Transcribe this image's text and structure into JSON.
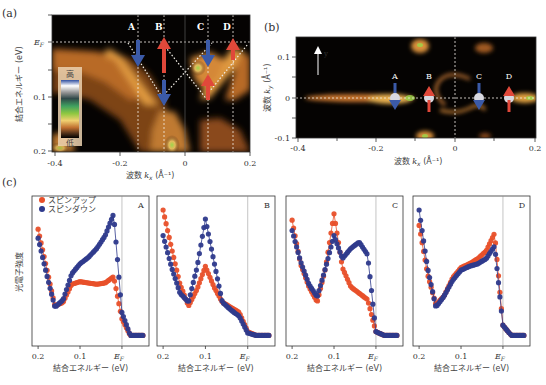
{
  "figure": {
    "panel_labels": [
      "(a)",
      "(b)",
      "(c)"
    ]
  },
  "panel_a": {
    "ylabel": "結合エネルギー (eV)",
    "xlabel": "波数 kx (Å⁻¹)",
    "xlabel_main": "波数 ",
    "xlabel_var": "k",
    "xlabel_sub": "x",
    "xlabel_unit": " (Å⁻¹)",
    "yticks": [
      "EF",
      "0.1",
      "0.2"
    ],
    "ytick_ef_main": "E",
    "ytick_ef_sub": "F",
    "xticks": [
      "-0.4",
      "-0.2",
      "0",
      "0.2"
    ],
    "cut_labels": [
      "A",
      "B",
      "C",
      "D"
    ],
    "colorbar": {
      "high": "高",
      "low": "低"
    }
  },
  "panel_b": {
    "ylabel": "波数 ky (Å⁻¹)",
    "ylabel_main": "波数 ",
    "ylabel_var": "k",
    "ylabel_sub": "y",
    "ylabel_unit": " (Å⁻¹)",
    "xlabel_main": "波数 ",
    "xlabel_var": "k",
    "xlabel_sub": "x",
    "xlabel_unit": " (Å⁻¹)",
    "yticks": [
      "0.1",
      "0",
      "-0.1"
    ],
    "xticks": [
      "-0.4",
      "-0.2",
      "0",
      "0.2"
    ],
    "axis_arrow_label": "y",
    "cut_labels": [
      "A",
      "B",
      "C",
      "D"
    ]
  },
  "panel_c": {
    "ylabel": "光電子強度",
    "xlabel": "結合エネルギー (eV)",
    "xticks": [
      "0.2",
      "0.1",
      "EF"
    ],
    "xtick_ef_main": "E",
    "xtick_ef_sub": "F",
    "legend": [
      "スピンアップ",
      "スピンダウン"
    ],
    "subpanels": [
      "A",
      "B",
      "C",
      "D"
    ]
  },
  "colors": {
    "spin_up": "#e8502a",
    "spin_down": "#2e3a8c",
    "arpes_bg": "#050302",
    "arpes_band": "#d98a3a"
  },
  "chart_data": [
    {
      "type": "heatmap",
      "title": "(a) ARPES band dispersion",
      "xlabel": "波数 kx (Å⁻¹)",
      "ylabel": "結合エネルギー (eV)",
      "xlim": [
        -0.4,
        0.2
      ],
      "ylim": [
        0.2,
        0.0
      ],
      "x_ticks": [
        -0.4,
        -0.2,
        0,
        0.2
      ],
      "y_ticks": [
        "EF",
        0.1,
        0.2
      ],
      "colorbar": [
        "高",
        "低"
      ],
      "cuts": [
        {
          "label": "A",
          "kx": -0.15,
          "spin": "down",
          "energy_of_arrow": 0.03
        },
        {
          "label": "B",
          "kx": -0.065,
          "spin": "up",
          "energy_of_arrow": 0.02
        },
        {
          "label": "B",
          "kx": -0.065,
          "spin": "down",
          "energy_of_arrow": 0.11
        },
        {
          "label": "C",
          "kx": 0.07,
          "spin": "down",
          "energy_of_arrow": 0.03
        },
        {
          "label": "C",
          "kx": 0.07,
          "spin": "up",
          "energy_of_arrow": 0.09
        },
        {
          "label": "D",
          "kx": 0.15,
          "spin": "up",
          "energy_of_arrow": 0.02
        }
      ]
    },
    {
      "type": "heatmap",
      "title": "(b) Fermi surface map",
      "xlabel": "波数 kx (Å⁻¹)",
      "ylabel": "波数 ky (Å⁻¹)",
      "xlim": [
        -0.4,
        0.2
      ],
      "ylim": [
        -0.1,
        0.15
      ],
      "x_ticks": [
        -0.4,
        -0.2,
        0,
        0.2
      ],
      "y_ticks": [
        0.1,
        0,
        -0.1
      ],
      "points": [
        {
          "label": "A",
          "kx": -0.15,
          "ky": 0,
          "spin": "down"
        },
        {
          "label": "B",
          "kx": -0.065,
          "spin": "up",
          "ky": 0
        },
        {
          "label": "C",
          "kx": 0.065,
          "ky": 0,
          "spin": "down"
        },
        {
          "label": "D",
          "kx": 0.14,
          "ky": 0,
          "spin": "up"
        }
      ]
    },
    {
      "type": "scatter",
      "title": "(c) Spin-resolved EDCs",
      "xlabel": "結合エネルギー (eV)",
      "ylabel": "光電子強度",
      "x_ticks": [
        0.2,
        0.1,
        "EF"
      ],
      "xlim": [
        0.21,
        -0.06
      ],
      "legend": [
        "スピンアップ",
        "スピンダウン"
      ],
      "x": [
        0.2,
        0.18,
        0.16,
        0.14,
        0.12,
        0.1,
        0.08,
        0.06,
        0.04,
        0.02,
        0.0,
        -0.02,
        -0.05
      ],
      "subpanels": [
        {
          "label": "A",
          "series": [
            {
              "name": "スピンアップ",
              "values": [
                0.85,
                0.55,
                0.25,
                0.28,
                0.42,
                0.44,
                0.43,
                0.42,
                0.43,
                0.48,
                0.15,
                0.02,
                0.02
              ]
            },
            {
              "name": "スピンダウン",
              "values": [
                0.78,
                0.5,
                0.24,
                0.3,
                0.5,
                0.58,
                0.63,
                0.7,
                0.8,
                0.97,
                0.2,
                0.02,
                0.02
              ]
            }
          ]
        },
        {
          "label": "B",
          "series": [
            {
              "name": "スピンアップ",
              "values": [
                1.0,
                0.7,
                0.42,
                0.25,
                0.38,
                0.56,
                0.4,
                0.28,
                0.24,
                0.2,
                0.05,
                0.02,
                0.02
              ]
            },
            {
              "name": "スピンダウン",
              "values": [
                0.8,
                0.55,
                0.35,
                0.28,
                0.55,
                0.93,
                0.6,
                0.28,
                0.22,
                0.17,
                0.04,
                0.02,
                0.02
              ]
            }
          ]
        },
        {
          "label": "C",
          "series": [
            {
              "name": "スピンアップ",
              "values": [
                0.92,
                0.58,
                0.4,
                0.28,
                0.55,
                0.97,
                0.55,
                0.4,
                0.35,
                0.3,
                0.05,
                0.02,
                0.02
              ]
            },
            {
              "name": "スピンダウン",
              "values": [
                0.84,
                0.6,
                0.42,
                0.32,
                0.55,
                0.8,
                0.62,
                0.7,
                0.75,
                0.65,
                0.05,
                0.02,
                0.02
              ]
            }
          ]
        },
        {
          "label": "D",
          "series": [
            {
              "name": "スピンアップ",
              "values": [
                0.88,
                0.5,
                0.26,
                0.33,
                0.47,
                0.55,
                0.58,
                0.62,
                0.68,
                0.82,
                0.1,
                0.02,
                0.02
              ]
            },
            {
              "name": "スピンダウン",
              "values": [
                1.0,
                0.55,
                0.24,
                0.33,
                0.45,
                0.53,
                0.56,
                0.58,
                0.62,
                0.72,
                0.1,
                0.02,
                0.02
              ]
            }
          ]
        }
      ]
    }
  ]
}
